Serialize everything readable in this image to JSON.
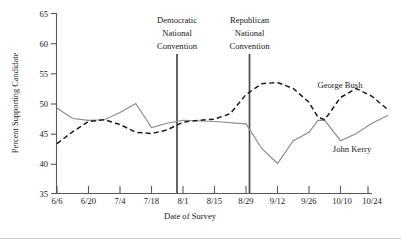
{
  "chart_data": {
    "type": "line",
    "title": "",
    "xlabel": "Date of Survey",
    "ylabel": "Percent Supporting Candidate",
    "ylim": [
      35,
      65
    ],
    "ytick_values": [
      35,
      40,
      45,
      50,
      55,
      60,
      65
    ],
    "ytick_labels": [
      "35",
      "40",
      "45",
      "50",
      "55",
      "60",
      "65"
    ],
    "categories": [
      "6/6",
      "6/20",
      "7/4",
      "7/18",
      "8/1",
      "8/15",
      "8/29",
      "9/12",
      "9/26",
      "10/10",
      "10/24"
    ],
    "xtick_labels": [
      "6/6",
      "6/20",
      "7/4",
      "7/18",
      "8/1",
      "8/15",
      "8/29",
      "9/12",
      "9/26",
      "10/10",
      "10/24"
    ],
    "grid": false,
    "legend_position": "inline-right",
    "series": [
      {
        "name": "John Kerry",
        "style": "solid",
        "color": "#8c8c8c",
        "x": [
          "6/6",
          "6/13",
          "6/20",
          "6/27",
          "7/4",
          "7/11",
          "7/18",
          "7/25",
          "8/1",
          "8/15",
          "8/29",
          "9/5",
          "9/12",
          "9/19",
          "9/26",
          "9/30",
          "10/3",
          "10/10",
          "10/17",
          "10/24",
          "10/31"
        ],
        "values": [
          49.2,
          47.5,
          47.2,
          47.3,
          48.5,
          50.0,
          46.0,
          46.7,
          47.2,
          47.0,
          46.6,
          42.5,
          40.0,
          43.8,
          45.2,
          47.2,
          47.2,
          43.8,
          45.0,
          46.7,
          48.0
        ]
      },
      {
        "name": "George Bush",
        "style": "dashed",
        "color": "#1a1a1a",
        "x": [
          "6/6",
          "6/13",
          "6/20",
          "6/27",
          "7/4",
          "7/11",
          "7/18",
          "7/25",
          "8/1",
          "8/8",
          "8/15",
          "8/22",
          "8/29",
          "9/5",
          "9/12",
          "9/19",
          "9/26",
          "9/30",
          "10/3",
          "10/10",
          "10/17",
          "10/24",
          "10/31"
        ],
        "values": [
          43.3,
          45.3,
          47.0,
          47.3,
          46.5,
          45.2,
          45.0,
          45.6,
          46.9,
          47.2,
          47.4,
          48.3,
          51.5,
          53.3,
          53.5,
          52.5,
          50.2,
          47.7,
          47.3,
          51.0,
          52.5,
          51.2,
          49.0
        ]
      }
    ],
    "annotations": [
      {
        "name": "democratic-national-convention",
        "lines": [
          "Democratic",
          "National",
          "Convention"
        ],
        "x": "8/1"
      },
      {
        "name": "republican-national-convention",
        "lines": [
          "Republican",
          "National",
          "Convention"
        ],
        "x": "8/30"
      }
    ],
    "series_labels": [
      {
        "name": "George Bush",
        "text": "George Bush"
      },
      {
        "name": "John Kerry",
        "text": "John Kerry"
      }
    ]
  }
}
